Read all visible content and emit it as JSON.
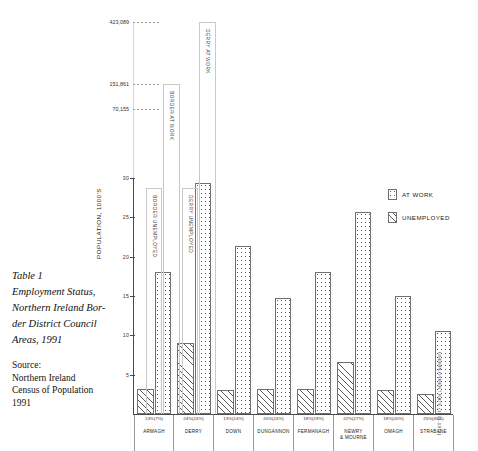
{
  "caption": {
    "lines": [
      "Table 1",
      "Employment Status,",
      "Northern Ireland Bor-",
      "der District Council",
      "Areas, 1991"
    ],
    "source_lines": [
      "Source:",
      "Northern Ireland",
      "Census of Population",
      "1991"
    ]
  },
  "legend": {
    "at_work": "AT WORK",
    "unemployed": "UNEMPLOYED"
  },
  "edge_note": "UNEMPLOYMENT RATE (1971-1971)",
  "chart_data": {
    "type": "bar",
    "xlabel": "",
    "ylabel": "POPULATION, 1000'S",
    "ylim": [
      0,
      30
    ],
    "yticks": [
      5,
      10,
      15,
      20,
      25,
      30
    ],
    "grid": false,
    "legend_position": "right",
    "categories": [
      "ARMAGH",
      "DERRY",
      "DOWN",
      "DUNGANNON",
      "FERMANAGH",
      "NEWRY\n& MOURNE",
      "OMAGH",
      "STRABANE"
    ],
    "category_percent_labels": [
      "13%(7%)",
      "24%(24%)",
      "13%(14%)",
      "20%(24%)",
      "18%(19%)",
      "22%(27%)",
      "18%(20%)",
      "25%(49%)"
    ],
    "series": [
      {
        "name": "AT WORK",
        "values": [
          18.0,
          29.4,
          21.4,
          14.8,
          18.0,
          25.7,
          15.0,
          10.5
        ]
      },
      {
        "name": "UNEMPLOYED",
        "values": [
          3.2,
          9.0,
          3.0,
          3.2,
          3.2,
          6.6,
          3.1,
          2.6
        ]
      }
    ],
    "broken_axis": {
      "reference_values": [
        "70,155",
        "151,861",
        "423,089"
      ],
      "overflow_bars": [
        {
          "label": "BORDER AT WORK",
          "top_value": "151,861"
        },
        {
          "label": "DERRY AT WORK",
          "top_value": "423,089"
        },
        {
          "label": "BORDER UNEMPLOYED",
          "top_value": ""
        },
        {
          "label": "DERRY UNEMPLOYED",
          "top_value": ""
        }
      ]
    }
  }
}
